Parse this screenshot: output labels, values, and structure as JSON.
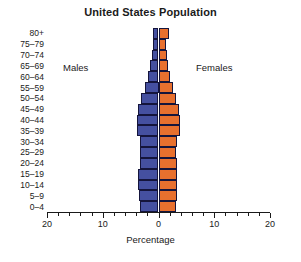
{
  "chart_data": {
    "type": "bar",
    "subtype": "population-pyramid",
    "title": "United States Population",
    "xlabel": "Percentage",
    "ylabel": "",
    "categories": [
      "0–4",
      "5–9",
      "10–14",
      "15–19",
      "20–24",
      "25–29",
      "30–34",
      "35–39",
      "40–44",
      "45–49",
      "50–54",
      "55–59",
      "60–64",
      "65–69",
      "70–74",
      "75–79",
      "80+"
    ],
    "series": [
      {
        "name": "Males",
        "color": "#4550a0",
        "side": "left",
        "values": [
          3.4,
          3.5,
          3.6,
          3.6,
          3.4,
          3.3,
          3.4,
          3.9,
          3.9,
          3.6,
          3.1,
          2.5,
          1.9,
          1.5,
          1.2,
          0.9,
          1.0
        ]
      },
      {
        "name": "Females",
        "color": "#e8702e",
        "side": "right",
        "values": [
          3.2,
          3.3,
          3.4,
          3.4,
          3.3,
          3.2,
          3.3,
          3.8,
          3.9,
          3.6,
          3.2,
          2.6,
          2.1,
          1.7,
          1.5,
          1.3,
          1.8
        ]
      }
    ],
    "xlim": [
      -20,
      20
    ],
    "x_tick_labels": [
      "20",
      "10",
      "0",
      "10",
      "20"
    ],
    "x_tick_values": [
      -20,
      -10,
      0,
      10,
      20
    ],
    "x_minor_tick_step": 2,
    "grid": false,
    "legend": "inline-annotations",
    "annotations": [
      {
        "text": "Males",
        "side": "left"
      },
      {
        "text": "Females",
        "side": "right"
      }
    ],
    "axis_line_color": "#1a1a1a",
    "background": "#ffffff"
  }
}
